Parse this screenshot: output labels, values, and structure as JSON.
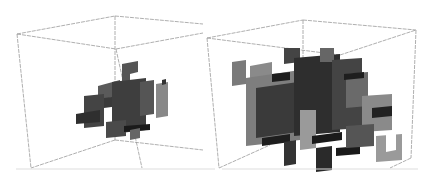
{
  "figure": {
    "panels": [
      {
        "id": "left",
        "label": "",
        "content": "sparse cluster of grey plates",
        "box_color": "#9a9a9a",
        "plate_shades": [
          "#3a3a3a",
          "#555555",
          "#6e6e6e",
          "#8a8a8a",
          "#1e1e1e"
        ]
      },
      {
        "id": "right",
        "label": "",
        "content": "dense cluster of grey plates",
        "box_color": "#9a9a9a",
        "plate_shades": [
          "#2c2c2c",
          "#444444",
          "#5e5e5e",
          "#7a7a7a",
          "#959595",
          "#151515"
        ]
      }
    ],
    "background": "#ffffff"
  }
}
